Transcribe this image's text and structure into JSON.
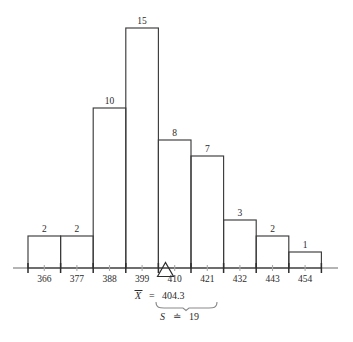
{
  "chart_data": {
    "type": "bar",
    "title": "",
    "subtitle": "",
    "xlabel": "",
    "ylabel": "",
    "grid": false,
    "legend": null,
    "categories": [
      "366",
      "377",
      "388",
      "399",
      "410",
      "421",
      "432",
      "443",
      "454"
    ],
    "values": [
      2,
      2,
      10,
      15,
      8,
      7,
      3,
      2,
      1
    ],
    "tick_labels": [
      "366",
      "377",
      "388",
      "399",
      "410",
      "421",
      "432",
      "443",
      "454"
    ],
    "bar_labels": [
      "2",
      "2",
      "10",
      "15",
      "8",
      "7",
      "3",
      "2",
      "1"
    ],
    "ylim": [
      0,
      15
    ],
    "xlim": [
      360.5,
      459.5
    ],
    "bin_width": 11,
    "total_count": 51,
    "annotations": {
      "mean_marker": {
        "symbol": "triangle",
        "label_variable": "X",
        "label_overbar": true,
        "equals": "=",
        "value": "404.3",
        "full_text": "X̅ = 404.3",
        "x_value": 404.3
      },
      "spread_brace": {
        "label_variable": "S",
        "equals": "≐",
        "value": "19",
        "full_text": "S ≐ 19",
        "span_from": 404.3,
        "span_to": 423.3
      }
    },
    "colors": {
      "bar_stroke": "#3c3c3c",
      "bar_fill": "none",
      "axis": "#6b6b6b",
      "tick_major": "#2e2e2e",
      "tick_minor": "#aaaaaa",
      "text": "#2b2b2b",
      "brace": "#8a8a8a",
      "background": "#ffffff"
    }
  }
}
